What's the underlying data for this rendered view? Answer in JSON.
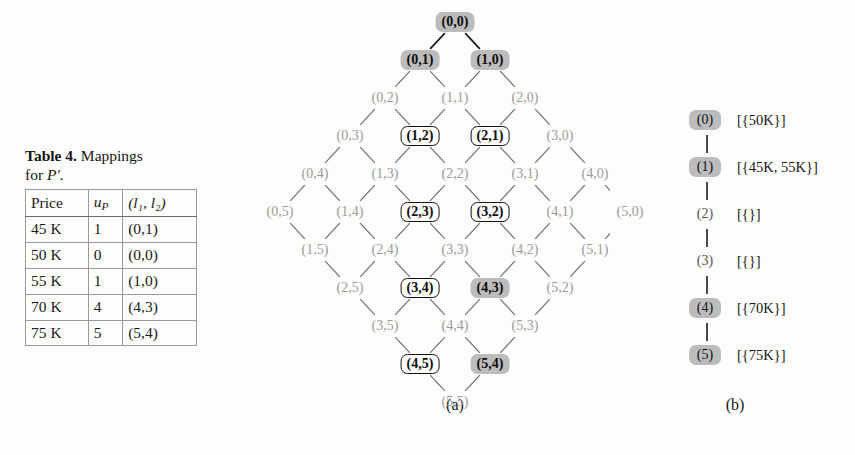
{
  "figure": {
    "caption_a": "(a)",
    "caption_b": "(b)"
  },
  "table": {
    "caption_label": "Table 4.",
    "caption_text_1": "Mappings",
    "caption_text_2": "for",
    "caption_symbol": "P′",
    "caption_period": ".",
    "columns": [
      {
        "key": "price",
        "label": "Price"
      },
      {
        "key": "up",
        "label": "u",
        "sub": "P"
      },
      {
        "key": "ll",
        "label": "(l₁, l₂)"
      }
    ],
    "rows": [
      {
        "price": "45 K",
        "up": "1",
        "ll": "(0,1)"
      },
      {
        "price": "50 K",
        "up": "0",
        "ll": "(0,0)"
      },
      {
        "price": "55 K",
        "up": "1",
        "ll": "(1,0)"
      },
      {
        "price": "70 K",
        "up": "4",
        "ll": "(4,3)"
      },
      {
        "price": "75 K",
        "up": "5",
        "ll": "(5,4)"
      }
    ]
  },
  "lattice": {
    "origin_x": 245,
    "origin_y": 22,
    "dx": 35,
    "dy": 38,
    "nodes": [
      {
        "label": "(0,0)",
        "i": 0,
        "j": 0,
        "style": "filled"
      },
      {
        "label": "(0,1)",
        "i": 0,
        "j": 1,
        "style": "filled"
      },
      {
        "label": "(1,0)",
        "i": 1,
        "j": 0,
        "style": "filled"
      },
      {
        "label": "(0,2)",
        "i": 0,
        "j": 2,
        "style": "plain"
      },
      {
        "label": "(1,1)",
        "i": 1,
        "j": 1,
        "style": "plain"
      },
      {
        "label": "(2,0)",
        "i": 2,
        "j": 0,
        "style": "plain"
      },
      {
        "label": "(0,3)",
        "i": 0,
        "j": 3,
        "style": "plain"
      },
      {
        "label": "(1,2)",
        "i": 1,
        "j": 2,
        "style": "boxed"
      },
      {
        "label": "(2,1)",
        "i": 2,
        "j": 1,
        "style": "boxed"
      },
      {
        "label": "(3,0)",
        "i": 3,
        "j": 0,
        "style": "plain"
      },
      {
        "label": "(0,4)",
        "i": 0,
        "j": 4,
        "style": "plain"
      },
      {
        "label": "(1,3)",
        "i": 1,
        "j": 3,
        "style": "plain"
      },
      {
        "label": "(2,2)",
        "i": 2,
        "j": 2,
        "style": "plain"
      },
      {
        "label": "(3,1)",
        "i": 3,
        "j": 1,
        "style": "plain"
      },
      {
        "label": "(4,0)",
        "i": 4,
        "j": 0,
        "style": "plain"
      },
      {
        "label": "(0,5)",
        "i": 0,
        "j": 5,
        "style": "plain"
      },
      {
        "label": "(1,4)",
        "i": 1,
        "j": 4,
        "style": "plain"
      },
      {
        "label": "(2,3)",
        "i": 2,
        "j": 3,
        "style": "boxed"
      },
      {
        "label": "(3,2)",
        "i": 3,
        "j": 2,
        "style": "boxed"
      },
      {
        "label": "(4,1)",
        "i": 4,
        "j": 1,
        "style": "plain"
      },
      {
        "label": "(5,0)",
        "i": 5,
        "j": 0,
        "style": "plain"
      },
      {
        "label": "(1,5)",
        "i": 1,
        "j": 5,
        "style": "plain"
      },
      {
        "label": "(2,4)",
        "i": 2,
        "j": 4,
        "style": "plain"
      },
      {
        "label": "(3,3)",
        "i": 3,
        "j": 3,
        "style": "plain"
      },
      {
        "label": "(4,2)",
        "i": 4,
        "j": 2,
        "style": "plain"
      },
      {
        "label": "(5,1)",
        "i": 5,
        "j": 1,
        "style": "plain"
      },
      {
        "label": "(2,5)",
        "i": 2,
        "j": 5,
        "style": "plain"
      },
      {
        "label": "(3,4)",
        "i": 3,
        "j": 4,
        "style": "boxed"
      },
      {
        "label": "(4,3)",
        "i": 4,
        "j": 3,
        "style": "filled"
      },
      {
        "label": "(5,2)",
        "i": 5,
        "j": 2,
        "style": "plain"
      },
      {
        "label": "(3,5)",
        "i": 3,
        "j": 5,
        "style": "plain"
      },
      {
        "label": "(4,4)",
        "i": 4,
        "j": 4,
        "style": "plain"
      },
      {
        "label": "(5,3)",
        "i": 5,
        "j": 3,
        "style": "plain"
      },
      {
        "label": "(4,5)",
        "i": 4,
        "j": 5,
        "style": "boxed"
      },
      {
        "label": "(5,4)",
        "i": 5,
        "j": 4,
        "style": "filled"
      },
      {
        "label": "(5,5)",
        "i": 5,
        "j": 5,
        "style": "plain"
      }
    ]
  },
  "chain": {
    "origin_x": 52,
    "origin_y": 120,
    "dy": 47,
    "items": [
      {
        "label": "(0)",
        "set": "[{50K}]",
        "style": "filled"
      },
      {
        "label": "(1)",
        "set": "[{45K, 55K}]",
        "style": "filled"
      },
      {
        "label": "(2)",
        "set": "[{}]",
        "style": "plain"
      },
      {
        "label": "(3)",
        "set": "[{}]",
        "style": "plain"
      },
      {
        "label": "(4)",
        "set": "[{70K}]",
        "style": "filled"
      },
      {
        "label": "(5)",
        "set": "[{75K}]",
        "style": "filled"
      }
    ]
  },
  "colors": {
    "highlight": "#bcbcbc",
    "edge": "#6f6f6f",
    "plain_text": "#9b9b9b",
    "strong_text": "#0d0d0d"
  }
}
